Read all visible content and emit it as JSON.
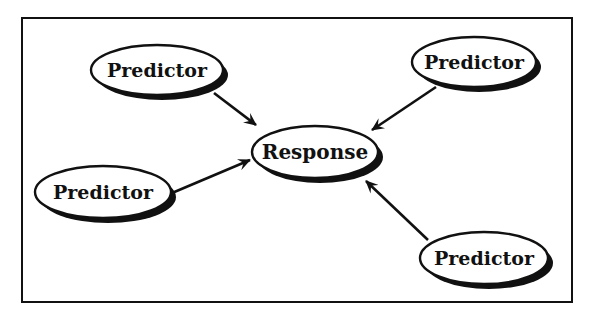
{
  "diagram": {
    "type": "causal-influence-diagram",
    "frame": {
      "x": 22,
      "y": 18,
      "width": 550,
      "height": 284,
      "stroke": "#111111"
    },
    "colors": {
      "ink": "#111111",
      "fill": "#ffffff",
      "shadow": "#111111"
    },
    "nodes": [
      {
        "id": "predictor-top-left",
        "label": "Predictor",
        "cx": 157,
        "cy": 70,
        "rx": 66,
        "ry": 25
      },
      {
        "id": "predictor-top-right",
        "label": "Predictor",
        "cx": 474,
        "cy": 62,
        "rx": 62,
        "ry": 25
      },
      {
        "id": "response",
        "label": "Response",
        "cx": 315,
        "cy": 152,
        "rx": 63,
        "ry": 26
      },
      {
        "id": "predictor-left",
        "label": "Predictor",
        "cx": 103,
        "cy": 192,
        "rx": 68,
        "ry": 26
      },
      {
        "id": "predictor-bottom-right",
        "label": "Predictor",
        "cx": 484,
        "cy": 258,
        "rx": 64,
        "ry": 26
      }
    ],
    "edges": [
      {
        "from": "predictor-top-left",
        "to": "response",
        "x1": 214,
        "y1": 93,
        "x2": 256,
        "y2": 125
      },
      {
        "from": "predictor-top-right",
        "to": "response",
        "x1": 436,
        "y1": 87,
        "x2": 372,
        "y2": 130
      },
      {
        "from": "predictor-left",
        "to": "response",
        "x1": 172,
        "y1": 193,
        "x2": 250,
        "y2": 160
      },
      {
        "from": "predictor-bottom-right",
        "to": "response",
        "x1": 428,
        "y1": 240,
        "x2": 366,
        "y2": 181
      }
    ]
  }
}
